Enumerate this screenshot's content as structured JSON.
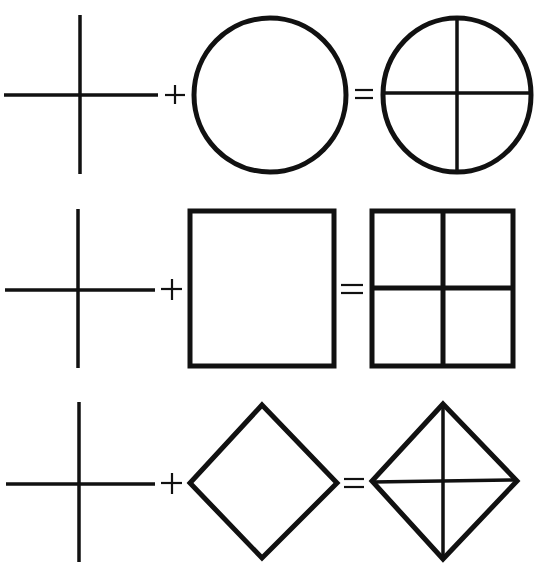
{
  "diagram": {
    "type": "shape-composition-equations",
    "stroke_color": "#111111",
    "background": "#ffffff",
    "rows": [
      {
        "operand_a": "cross",
        "operator_1": "+",
        "operand_b": "circle",
        "operator_2": "=",
        "result": "circle divided into quadrants by cross"
      },
      {
        "operand_a": "cross",
        "operator_1": "+",
        "operand_b": "square",
        "operator_2": "=",
        "result": "square divided into four quadrants by cross"
      },
      {
        "operand_a": "cross",
        "operator_1": "+",
        "operand_b": "diamond",
        "operator_2": "=",
        "result": "diamond divided into four triangles by cross"
      }
    ]
  }
}
